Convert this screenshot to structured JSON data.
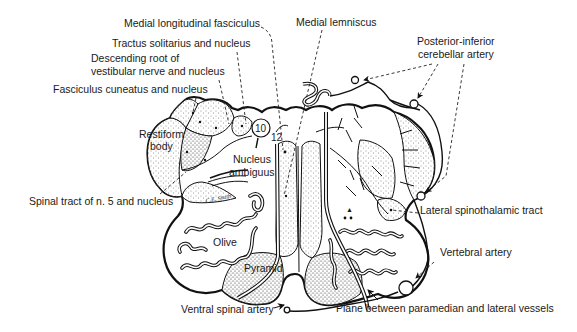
{
  "figure": {
    "artist_signature": "C.E. Smith",
    "labels": {
      "medial_longitudinal_fasciculus": "Medial longitudinal fasciculus",
      "medial_lemniscus": "Medial lemniscus",
      "tractus_solitarius": "Tractus solitarius and nucleus",
      "descending_root_line1": "Descending root of",
      "descending_root_line2": "vestibular nerve and nucleus",
      "fasciculus_cuneatus": "Fasciculus cuneatus and nucleus",
      "posterior_inferior_line1": "Posterior-inferior",
      "posterior_inferior_line2": "cerebellar artery",
      "restiform_line1": "Restiform",
      "restiform_line2": "body",
      "nerve_10": "10",
      "nerve_12": "12",
      "nucleus_ambiguus_line1": "Nucleus",
      "nucleus_ambiguus_line2": "ambiguus",
      "spinal_tract": "Spinal tract of n. 5 and nucleus",
      "lateral_spinothalamic": "Lateral spinothalamic tract",
      "olive": "Olive",
      "pyramid": "Pyramid",
      "vertebral_artery": "Vertebral artery",
      "ventral_spinal_artery": "Ventral spinal artery",
      "plane_between": "Plane between paramedian and lateral vessels"
    }
  }
}
